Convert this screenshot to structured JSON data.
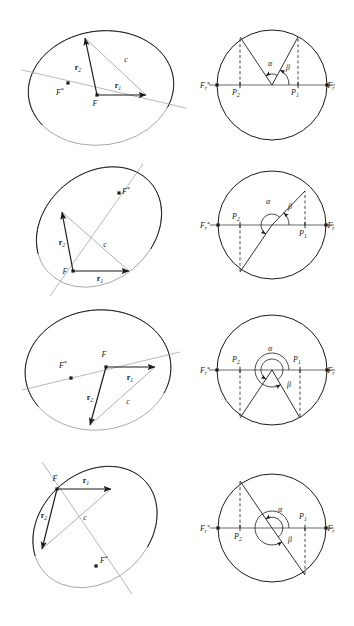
{
  "figure": {
    "background": "#ffffff",
    "stroke_dark": "#1a1a1a",
    "stroke_light": "#9a9a9a",
    "width": 354,
    "height": 626
  },
  "labels": {
    "r1": "r",
    "r1_sub": "1",
    "r2": "r",
    "r2_sub": "2",
    "c": "c",
    "F": "F",
    "Fstar": "F",
    "Fstar_sup": "*",
    "alpha": "α",
    "beta": "β",
    "P1": "P",
    "P1_sub": "1",
    "P2": "P",
    "P2_sub": "2",
    "Fr": "F",
    "Fr_sub": "r",
    "Frstar": "F",
    "Frstar_sub": "r",
    "Frstar_sup": "*"
  },
  "rows": [
    {
      "name": "row-1",
      "left": {
        "name": "ellipse-panel-1",
        "cx": 101,
        "cy": 88,
        "rx": 73,
        "ry": 57,
        "rotate": -8,
        "F": {
          "x": 97,
          "y": 95
        },
        "Fstar": {
          "x": 68,
          "y": 83
        },
        "r1_tip": {
          "x": 146,
          "y": 95
        },
        "r2_tip": {
          "x": 85,
          "y": 38
        },
        "c_tip": {
          "x": 146,
          "y": 95
        },
        "axis": {
          "x1": 22,
          "y1": 70,
          "x2": 186,
          "y2": 108
        },
        "r1_label": {
          "x": 118,
          "y": 88
        },
        "r2_label": {
          "x": 78,
          "y": 70
        },
        "c_label": {
          "x": 126,
          "y": 62
        },
        "F_label": {
          "x": 95,
          "y": 106
        },
        "Fstar_label": {
          "x": 60,
          "y": 95
        }
      },
      "right": {
        "name": "circle-panel-1",
        "cx": 272,
        "cy": 85,
        "r": 55,
        "P1": {
          "x": 298,
          "y": 85
        },
        "P2": {
          "x": 240,
          "y": 85
        },
        "ray1_tip": {
          "x": 298,
          "y": 37
        },
        "ray2_tip": {
          "x": 240,
          "y": 37
        },
        "alpha_label": {
          "x": 270,
          "y": 66
        },
        "beta_label": {
          "x": 288,
          "y": 70
        },
        "P1_label": {
          "x": 295,
          "y": 95
        },
        "P2_label": {
          "x": 236,
          "y": 95
        },
        "Fr_label": {
          "x": 331,
          "y": 88
        },
        "Frstar_label": {
          "x": 205,
          "y": 88
        }
      }
    },
    {
      "name": "row-2",
      "left": {
        "name": "ellipse-panel-2",
        "cx": 99,
        "cy": 227,
        "rx": 68,
        "ry": 54,
        "rotate": -40,
        "F": {
          "x": 73,
          "y": 271
        },
        "Fstar": {
          "x": 119,
          "y": 193
        },
        "r1_tip": {
          "x": 129,
          "y": 271
        },
        "r2_tip": {
          "x": 62,
          "y": 212
        },
        "c_tip": {
          "x": 129,
          "y": 271
        },
        "axis": {
          "x1": 50,
          "y1": 296,
          "x2": 143,
          "y2": 164
        },
        "r1_label": {
          "x": 100,
          "y": 281
        },
        "r2_label": {
          "x": 62,
          "y": 245
        },
        "c_label": {
          "x": 105,
          "y": 247
        },
        "F_label": {
          "x": 65,
          "y": 274
        },
        "Fstar_label": {
          "x": 126,
          "y": 194
        }
      },
      "right": {
        "name": "circle-panel-2",
        "cx": 272,
        "cy": 225,
        "r": 54,
        "P1": {
          "x": 305,
          "y": 225
        },
        "P2": {
          "x": 240,
          "y": 225
        },
        "ray1_tip": {
          "x": 305,
          "y": 191
        },
        "ray2_tip": {
          "x": 240,
          "y": 272
        },
        "alpha_label": {
          "x": 268,
          "y": 204
        },
        "beta_label": {
          "x": 290,
          "y": 209
        },
        "P1_label": {
          "x": 303,
          "y": 236
        },
        "P2_label": {
          "x": 236,
          "y": 219
        },
        "Fr_label": {
          "x": 331,
          "y": 228
        },
        "Frstar_label": {
          "x": 205,
          "y": 228
        }
      }
    },
    {
      "name": "row-3",
      "left": {
        "name": "ellipse-panel-3",
        "cx": 98,
        "cy": 370,
        "rx": 73,
        "ry": 60,
        "rotate": -6,
        "F": {
          "x": 106,
          "y": 367
        },
        "Fstar": {
          "x": 71,
          "y": 378
        },
        "r1_tip": {
          "x": 155,
          "y": 367
        },
        "r2_tip": {
          "x": 90,
          "y": 425
        },
        "c_tip": {
          "x": 155,
          "y": 367
        },
        "axis": {
          "x1": 22,
          "y1": 390,
          "x2": 180,
          "y2": 352
        },
        "r1_label": {
          "x": 130,
          "y": 380
        },
        "r2_label": {
          "x": 90,
          "y": 400
        },
        "c_label": {
          "x": 128,
          "y": 404
        },
        "F_label": {
          "x": 104,
          "y": 357
        },
        "Fstar_label": {
          "x": 63,
          "y": 368
        }
      },
      "right": {
        "name": "circle-panel-3",
        "cx": 272,
        "cy": 370,
        "r": 55,
        "P1": {
          "x": 300,
          "y": 370
        },
        "P2": {
          "x": 240,
          "y": 370
        },
        "ray1_tip": {
          "x": 300,
          "y": 418
        },
        "ray2_tip": {
          "x": 240,
          "y": 418
        },
        "alpha_label": {
          "x": 270,
          "y": 351
        },
        "beta_label": {
          "x": 289,
          "y": 387
        },
        "P1_label": {
          "x": 297,
          "y": 362
        },
        "P2_label": {
          "x": 236,
          "y": 362
        },
        "Fr_label": {
          "x": 331,
          "y": 373
        },
        "Frstar_label": {
          "x": 205,
          "y": 373
        }
      }
    },
    {
      "name": "row-4",
      "left": {
        "name": "ellipse-panel-4",
        "cx": 95,
        "cy": 527,
        "rx": 68,
        "ry": 54,
        "rotate": -42,
        "F": {
          "x": 57,
          "y": 489
        },
        "Fstar": {
          "x": 96,
          "y": 566
        },
        "r1_tip": {
          "x": 111,
          "y": 489
        },
        "r2_tip": {
          "x": 42,
          "y": 549
        },
        "c_tip": {
          "x": 111,
          "y": 489
        },
        "axis": {
          "x1": 42,
          "y1": 462,
          "x2": 132,
          "y2": 594
        },
        "r1_label": {
          "x": 86,
          "y": 483
        },
        "r2_label": {
          "x": 44,
          "y": 518
        },
        "c_label": {
          "x": 85,
          "y": 520
        },
        "F_label": {
          "x": 55,
          "y": 481
        },
        "Fstar_label": {
          "x": 104,
          "y": 563
        }
      },
      "right": {
        "name": "circle-panel-4",
        "cx": 272,
        "cy": 528,
        "r": 54,
        "P1": {
          "x": 305,
          "y": 528
        },
        "P2": {
          "x": 240,
          "y": 528
        },
        "ray1_tip": {
          "x": 305,
          "y": 575
        },
        "ray2_tip": {
          "x": 240,
          "y": 481
        },
        "alpha_label": {
          "x": 280,
          "y": 512
        },
        "beta_label": {
          "x": 290,
          "y": 542
        },
        "P1_label": {
          "x": 303,
          "y": 519
        },
        "P2_label": {
          "x": 238,
          "y": 539
        },
        "Fr_label": {
          "x": 331,
          "y": 531
        },
        "Frstar_label": {
          "x": 205,
          "y": 531
        }
      }
    }
  ]
}
